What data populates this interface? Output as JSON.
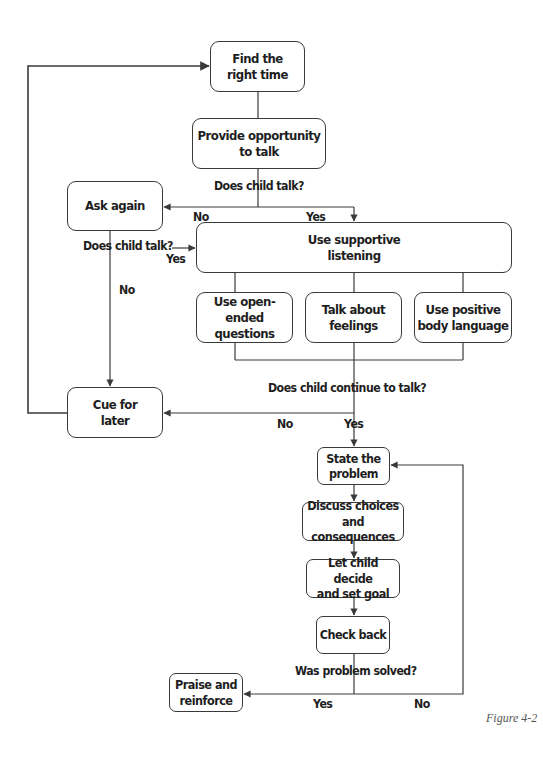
{
  "nodes": {
    "find_time": "Find the\nright time",
    "provide_opportunity": "Provide opportunity\nto talk",
    "ask_again": "Ask again",
    "supportive_listening": "Use supportive\nlistening",
    "open_ended": "Use open-ended\nquestions",
    "talk_feelings": "Talk about\nfeelings",
    "body_language": "Use positive\nbody language",
    "cue_later": "Cue for\nlater",
    "state_problem": "State the\nproblem",
    "discuss_choices": "Discuss choices\nand consequences",
    "let_child_decide": "Let child decide\nand set goal",
    "check_back": "Check back",
    "praise": "Praise and\nreinforce"
  },
  "labels": {
    "q_does_child_talk_1": "Does child talk?",
    "no_1": "No",
    "yes_1": "Yes",
    "q_does_child_talk_2": "Does child talk?",
    "yes_2": "Yes",
    "no_2": "No",
    "q_continue": "Does child continue to talk?",
    "no_3": "No",
    "yes_3": "Yes",
    "q_solved": "Was problem solved?",
    "yes_4": "Yes",
    "no_4": "No"
  },
  "caption": "Figure 4-2",
  "colors": {
    "line": "#3a3a3a",
    "text": "#1e1e1e"
  }
}
